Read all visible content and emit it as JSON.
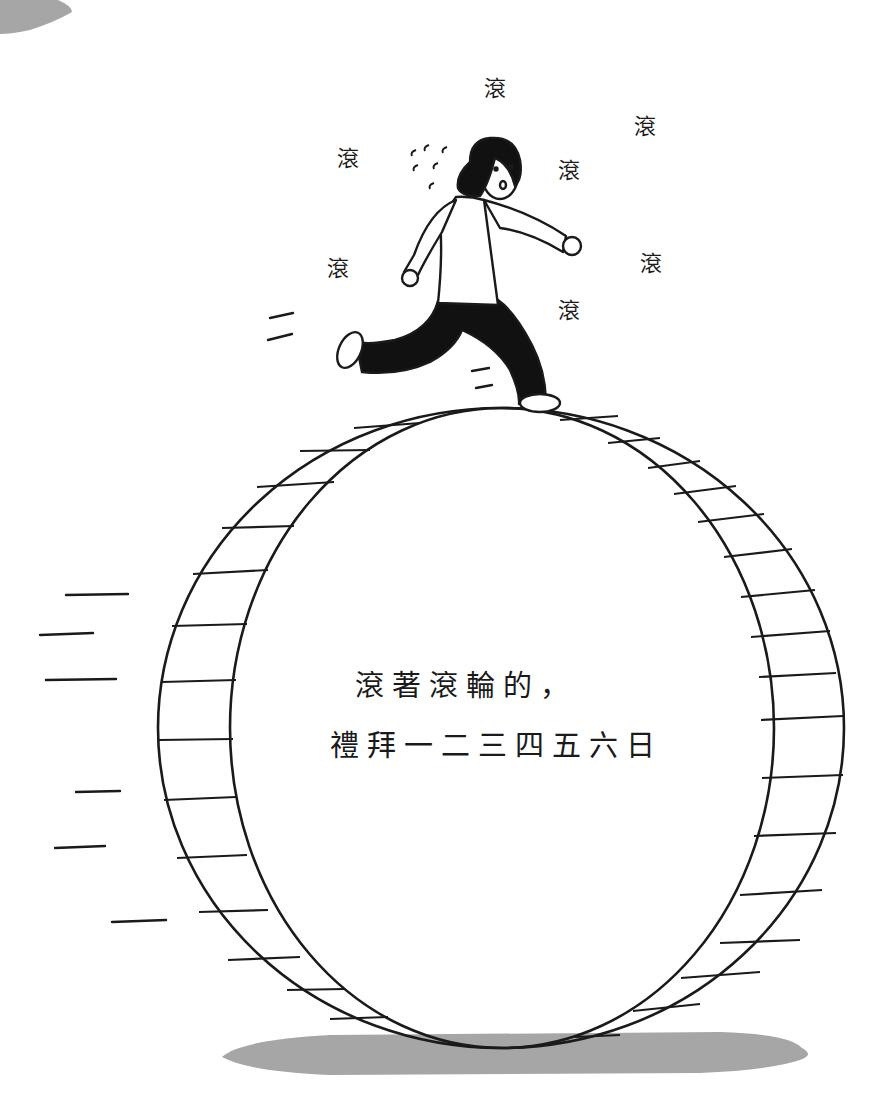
{
  "illustration": {
    "subject": "person running on top of a giant hamster wheel",
    "caption": {
      "line1": "滾著滾輪的，",
      "line2": "禮拜一二三四五六日"
    },
    "sound_effects": [
      {
        "text": "滾",
        "x": 484,
        "y": 70
      },
      {
        "text": "滾",
        "x": 634,
        "y": 108
      },
      {
        "text": "滾",
        "x": 337,
        "y": 140
      },
      {
        "text": "滾",
        "x": 558,
        "y": 152
      },
      {
        "text": "滾",
        "x": 327,
        "y": 250
      },
      {
        "text": "滾",
        "x": 640,
        "y": 245
      },
      {
        "text": "滾",
        "x": 558,
        "y": 292
      }
    ],
    "colors": {
      "ink": "#1a1a1a",
      "shadow": "#a6a6a6",
      "background": "#ffffff"
    }
  }
}
